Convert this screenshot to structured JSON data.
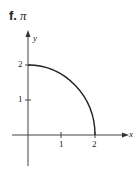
{
  "title": {
    "letter": "f.",
    "value": "π"
  },
  "axes": {
    "x_label": "x",
    "y_label": "y"
  },
  "x_ticks": [
    "1",
    "2"
  ],
  "y_ticks": [
    "1",
    "2"
  ],
  "curve": {
    "description": "quarter circle of radius 2 in first quadrant",
    "color": "#222222"
  }
}
